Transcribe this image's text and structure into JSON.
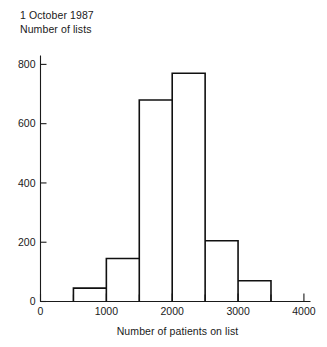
{
  "figure": {
    "caption_lines": [
      "1 October 1987",
      "Number of lists"
    ],
    "x_axis_title": "Number of patients on list"
  },
  "chart_data": {
    "type": "bar",
    "title": "1 October 1987",
    "subtitle": "Number of lists",
    "xlabel": "Number of patients on list",
    "ylabel": "Number of lists",
    "xlim": [
      0,
      4100
    ],
    "ylim": [
      0,
      830
    ],
    "grid": false,
    "legend": null,
    "bin_width": 500,
    "bin_edges": [
      500,
      1000,
      1500,
      2000,
      2500,
      3000,
      3500
    ],
    "categories": [
      "500-1000",
      "1000-1500",
      "1500-2000",
      "2000-2500",
      "2500-3000",
      "3000-3500"
    ],
    "values": [
      45,
      145,
      680,
      770,
      205,
      70
    ],
    "bars": [
      {
        "x_start": 500,
        "x_end": 1000,
        "value": 45
      },
      {
        "x_start": 1000,
        "x_end": 1500,
        "value": 145
      },
      {
        "x_start": 1500,
        "x_end": 2000,
        "value": 680
      },
      {
        "x_start": 2000,
        "x_end": 2500,
        "value": 770
      },
      {
        "x_start": 2500,
        "x_end": 3000,
        "value": 205
      },
      {
        "x_start": 3000,
        "x_end": 3500,
        "value": 70
      }
    ],
    "y_ticks": [
      0,
      200,
      400,
      600,
      800
    ],
    "y_tick_labels": [
      "0",
      "200",
      "400",
      "600",
      "800"
    ],
    "x_ticks": [
      0,
      500,
      1000,
      1500,
      2000,
      2500,
      3000,
      3500,
      4000
    ],
    "x_tick_labels_major": [
      "0",
      "1000",
      "2000",
      "3000",
      "4000"
    ],
    "x_major_ticks": [
      0,
      1000,
      2000,
      3000,
      4000
    ],
    "colors": {
      "bar_stroke": "#101010",
      "bar_fill": "none",
      "axis": "#1a1a1a",
      "background": "#ffffff"
    }
  }
}
